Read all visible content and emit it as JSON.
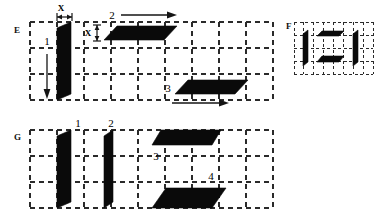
{
  "figure": {
    "background_color": "#ffffff",
    "ink_color": "#0a0a0a",
    "grid_color": "#2a2a2a",
    "panels": [
      {
        "id": "E",
        "letter": "E",
        "grid_columns": 9,
        "grid_rows": 3,
        "shape_labels": [
          "1",
          "2",
          "3"
        ],
        "dimension_labels": [
          "X",
          "X"
        ],
        "arrows": [
          "down-arrow",
          "right-arrow-2",
          "right-arrow-3"
        ]
      },
      {
        "id": "F",
        "letter": "F",
        "grid_columns": 8,
        "grid_rows": 4,
        "shape_labels": [],
        "dimension_labels": [],
        "arrows": []
      },
      {
        "id": "G",
        "letter": "G",
        "grid_columns": 9,
        "grid_rows": 3,
        "shape_labels": [
          "1",
          "2",
          "3",
          "4"
        ],
        "dimension_labels": [],
        "arrows": []
      }
    ]
  },
  "panelE": {
    "letter": "E",
    "label_1": "1",
    "label_2": "2",
    "label_3": "3",
    "dim_x_top": "X",
    "dim_x_side": "X"
  },
  "panelF": {
    "letter": "F"
  },
  "panelG": {
    "letter": "G",
    "label_1": "1",
    "label_2": "2",
    "label_3": "3",
    "label_4": "4"
  }
}
